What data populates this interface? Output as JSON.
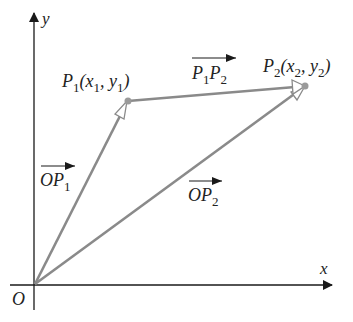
{
  "diagram": {
    "axes": {
      "x_label": "x",
      "y_label": "y",
      "origin_label": "O"
    },
    "points": [
      {
        "name": "P1",
        "label_main": "P",
        "label_sub": "1",
        "label_rest": "(x",
        "label_rest_sub": "1",
        "label_rest2": ", y",
        "label_rest2_sub": "1",
        "label_close": ")"
      },
      {
        "name": "P2",
        "label_main": "P",
        "label_sub": "2",
        "label_rest": "(x",
        "label_rest_sub": "2",
        "label_rest2": ", y",
        "label_rest2_sub": "2",
        "label_close": ")"
      }
    ],
    "vectors": [
      {
        "name": "OP1",
        "a": "O",
        "b": "P",
        "b_sub": "1"
      },
      {
        "name": "OP2",
        "a": "O",
        "b": "P",
        "b_sub": "2"
      },
      {
        "name": "P1P2",
        "a": "P",
        "a_sub": "1",
        "b": "P",
        "b_sub": "2"
      }
    ],
    "colors": {
      "vector": "#8a8a8a",
      "axis": "#1a1a1a",
      "point": "#9a9a9a"
    }
  }
}
